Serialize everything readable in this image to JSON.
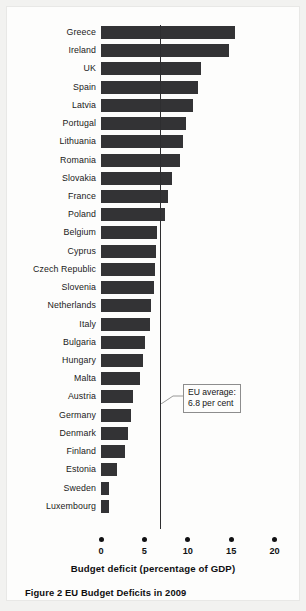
{
  "figure": {
    "caption": "Figure 2  EU Budget Deficits in 2009",
    "axis_title": "Budget deficit (percentage of GDP)",
    "annotation": {
      "line1": "EU average:",
      "line2": "6.8 per cent",
      "value": 6.8
    },
    "colors": {
      "bar": "#333335",
      "page_background": "#f2f2f0",
      "paper": "#fdfdfc",
      "text": "#111113",
      "reference_line": "#2e2e30"
    }
  },
  "chart_data": {
    "type": "bar",
    "orientation": "horizontal",
    "title": "Figure 2  EU Budget Deficits in 2009",
    "xlabel": "Budget deficit (percentage of GDP)",
    "ylabel": "",
    "xlim": [
      0,
      20
    ],
    "xticks": [
      0,
      5,
      10,
      15,
      20
    ],
    "xtick_labels": [
      "0",
      "5",
      "10",
      "15",
      "20"
    ],
    "grid": false,
    "legend": "none",
    "annotations": [
      {
        "text": "EU average: 6.8 per cent",
        "type": "vertical-reference-line",
        "value": 6.8
      }
    ],
    "categories": [
      "Greece",
      "Ireland",
      "UK",
      "Spain",
      "Latvia",
      "Portugal",
      "Lithuania",
      "Romania",
      "Slovakia",
      "France",
      "Poland",
      "Belgium",
      "Cyprus",
      "Czech Republic",
      "Slovenia",
      "Netherlands",
      "Italy",
      "Bulgaria",
      "Hungary",
      "Malta",
      "Austria",
      "Germany",
      "Denmark",
      "Finland",
      "Estonia",
      "Sweden",
      "Luxembourg"
    ],
    "values": [
      15.4,
      14.8,
      11.5,
      11.2,
      10.6,
      9.8,
      9.5,
      9.1,
      8.2,
      7.7,
      7.4,
      6.4,
      6.3,
      6.2,
      6.1,
      5.8,
      5.6,
      5.1,
      4.8,
      4.5,
      3.7,
      3.4,
      3.1,
      2.8,
      1.8,
      0.9,
      0.9
    ],
    "series": [
      {
        "name": "Budget deficit (percentage of GDP), 2009",
        "values": [
          15.4,
          14.8,
          11.5,
          11.2,
          10.6,
          9.8,
          9.5,
          9.1,
          8.2,
          7.7,
          7.4,
          6.4,
          6.3,
          6.2,
          6.1,
          5.8,
          5.6,
          5.1,
          4.8,
          4.5,
          3.7,
          3.4,
          3.1,
          2.8,
          1.8,
          0.9,
          0.9
        ]
      }
    ]
  }
}
